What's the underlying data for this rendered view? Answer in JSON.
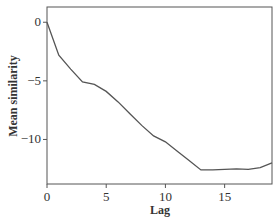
{
  "chart_data": {
    "type": "line",
    "title": "",
    "xlabel": "Lag",
    "ylabel": "Mean similarity",
    "xlim": [
      0,
      19
    ],
    "ylim": [
      -13.8,
      1.3
    ],
    "xticks": [
      0,
      5,
      10,
      15
    ],
    "yticks": [
      0,
      -5,
      -10
    ],
    "grid": false,
    "legend": null,
    "series": [
      {
        "name": "Mean similarity",
        "x": [
          0,
          1,
          2,
          3,
          4,
          5,
          6,
          7,
          8,
          9,
          10,
          11,
          12,
          13,
          14,
          15,
          16,
          17,
          18,
          19
        ],
        "values": [
          0,
          -2.8,
          -4.0,
          -5.1,
          -5.3,
          -5.9,
          -6.8,
          -7.8,
          -8.8,
          -9.7,
          -10.2,
          -11.0,
          -11.8,
          -12.6,
          -12.6,
          -12.55,
          -12.5,
          -12.55,
          -12.4,
          -12.0
        ]
      }
    ]
  },
  "axes": {
    "x_title": "Lag",
    "y_title": "Mean similarity"
  }
}
